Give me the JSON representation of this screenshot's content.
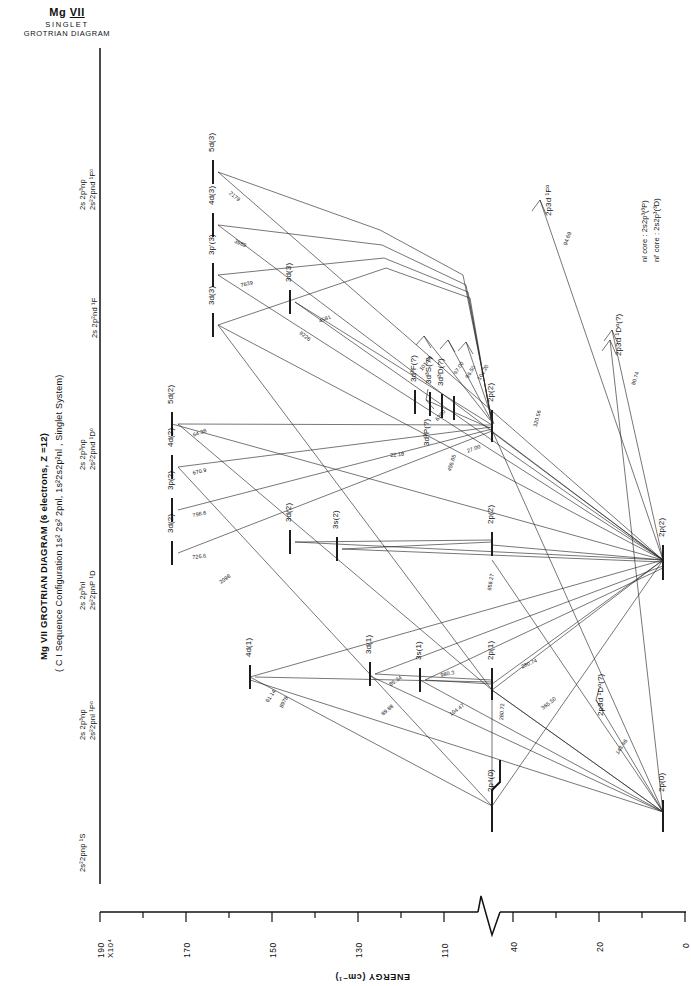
{
  "header": {
    "species": "Mg",
    "ion": "VII",
    "line2": "SINGLET",
    "line3": "GROTRIAN DIAGRAM"
  },
  "title": {
    "main": "Mg VII  GROTRIAN DIAGRAM (6 electrons, Z =12)",
    "sub": "( C I Sequence Configuration 1s² 2s² 2pnl, 1s²2s2p²nl , Singlet System)"
  },
  "notes": {
    "core1": "nl core :  2s2p³(³P)",
    "core2": "nl' core :  2s2p³(³D)"
  },
  "axis": {
    "title": "ENERGY (cm⁻¹)",
    "exp_label": "X10⁴",
    "ticks": [
      "190",
      "170",
      "150",
      "130",
      "110",
      "40",
      "20",
      "0"
    ],
    "break": true
  },
  "columns": [
    {
      "id": "S",
      "l1": "",
      "l2": "2s²2pnp ¹S"
    },
    {
      "id": "Po",
      "l1": "2s 2p³np",
      "l2": "2s²2pnl  ¹Pᵒ"
    },
    {
      "id": "D",
      "l1": "2s 2p³nl",
      "l2": "2s²2pnP ¹D"
    },
    {
      "id": "Do",
      "l1": "2s 2p³np",
      "l2": "2s²2pnd ¹Dᵒ"
    },
    {
      "id": "F",
      "l1": "",
      "l2": "2s 2p²nd ¹F"
    },
    {
      "id": "Fo",
      "l1": "2s 2p³np",
      "l2": "2s²2pnd ¹Fᵒ"
    }
  ],
  "levels": [
    {
      "name": "5d(3)",
      "col": "Fo"
    },
    {
      "name": "4d(3)",
      "col": "Fo"
    },
    {
      "name": "3p'(3)",
      "col": "Fo"
    },
    {
      "name": "3d(3)",
      "col": "Fo"
    },
    {
      "name": "3d(3)",
      "col": "F"
    },
    {
      "name": "3d³F(?)",
      "col": "Do"
    },
    {
      "name": "3d³S(?)",
      "col": "Do"
    },
    {
      "name": "3d³D(?)",
      "col": "Do"
    },
    {
      "name": "3d³P(?)",
      "col": "Do"
    },
    {
      "name": "5d(2)",
      "col": "Do"
    },
    {
      "name": "4d(2)",
      "col": "Do"
    },
    {
      "name": "3p(2)",
      "col": "Do"
    },
    {
      "name": "3d(2)",
      "col": "Do"
    },
    {
      "name": "2p(2)",
      "col": "Do"
    },
    {
      "name": "3d(2)",
      "col": "D"
    },
    {
      "name": "3s(2)",
      "col": "D"
    },
    {
      "name": "2p(2)",
      "col": "D"
    },
    {
      "name": "2p(2)",
      "col": "S"
    },
    {
      "name": "4d(1)",
      "col": "Po"
    },
    {
      "name": "3d(1)",
      "col": "Po"
    },
    {
      "name": "3s(1)",
      "col": "Po"
    },
    {
      "name": "2p(1)",
      "col": "Po"
    },
    {
      "name": "2p⁴(0)",
      "col": "S"
    },
    {
      "name": "2p(0)",
      "col": "S"
    },
    {
      "name": "2p3d ¹Dᵒ(?)",
      "col": "Po"
    },
    {
      "name": "2p3d ¹Dᵒ(?)",
      "col": "Do"
    },
    {
      "name": "2p3d ¹Fᵒ",
      "col": "Fo"
    }
  ],
  "wavelengths": [
    "2179",
    "3989",
    "7639",
    "4581",
    "9226",
    "6200",
    "101.50",
    "97.00",
    "96.50",
    "104.20",
    "64.38",
    "670.9",
    "798.6",
    "22.18",
    "726.6",
    "455.65",
    "659.27",
    "320.56",
    "61.14",
    "85.34",
    "89.88",
    "980.3",
    "104.47",
    "280.72",
    "280.74",
    "365.50",
    "143.96",
    "80.74",
    "94.69",
    "8978",
    "2098",
    "27.00"
  ]
}
